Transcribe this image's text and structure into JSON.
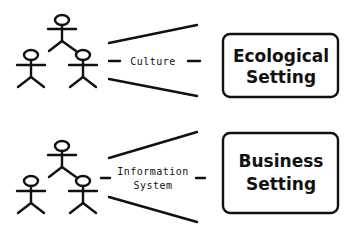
{
  "groups": [
    {
      "connector_label_lines": [
        "Culture"
      ],
      "box_label_lines": [
        "Ecological",
        "Setting"
      ]
    },
    {
      "connector_label_lines": [
        "Information",
        "System"
      ],
      "box_label_lines": [
        "Business",
        "Setting"
      ]
    }
  ],
  "colors": {
    "stroke": "#111111",
    "background": "#ffffff"
  }
}
